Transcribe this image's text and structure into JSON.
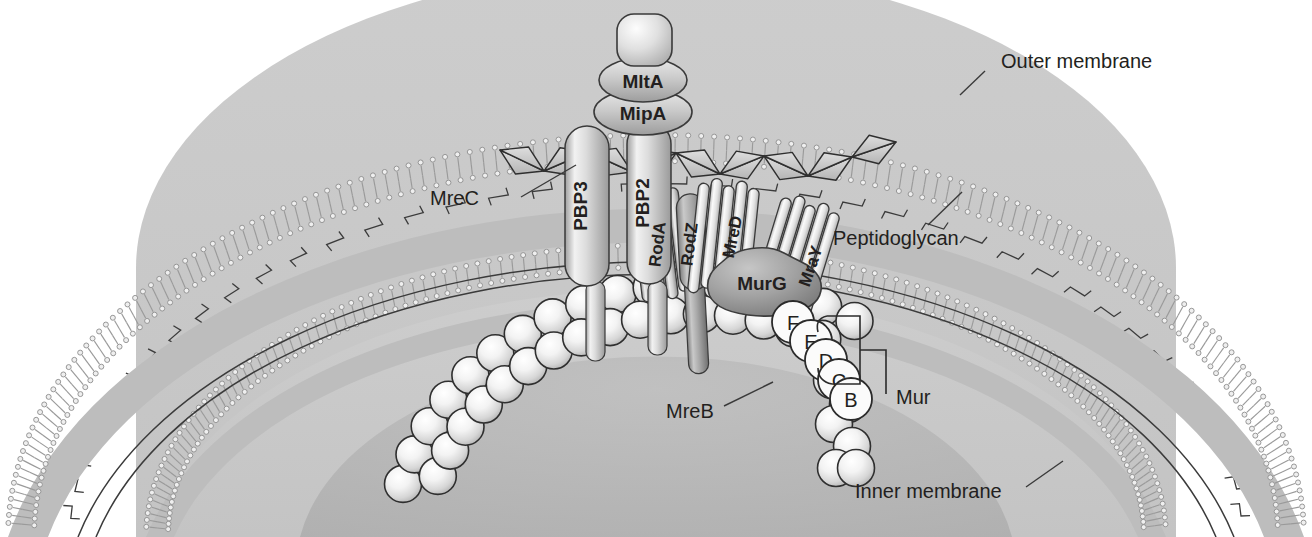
{
  "figure": {
    "type": "biological-schematic"
  },
  "labels": {
    "outer_membrane": "Outer membrane",
    "peptidoglycan": "Peptidoglycan",
    "inner_membrane": "Inner membrane",
    "mrec": "MreC",
    "mreb": "MreB",
    "mur": "Mur"
  },
  "proteins": {
    "mlta": "MltA",
    "mipa": "MipA",
    "pbp3": "PBP3",
    "pbp2": "PBP2",
    "roda": "RodA",
    "rodz": "RodZ",
    "mred": "MreD",
    "murg": "MurG",
    "mray": "MraY"
  },
  "mur_enzymes": [
    {
      "letter": "F"
    },
    {
      "letter": "E"
    },
    {
      "letter": "D"
    },
    {
      "letter": "C"
    },
    {
      "letter": "B"
    }
  ],
  "colors": {
    "background": "#ffffff",
    "periplasm": "#ffffff",
    "cytoplasm_outer": "#c9c9c9",
    "cytoplasm_inner": "#b4b4b4",
    "membrane_fill": "#b9b9b9",
    "membrane_head": "#d8d8d8",
    "outline": "#2e2e2e",
    "text": "#231f20",
    "protein_light": "#e8e8e8",
    "protein_mid": "#c2c2c2",
    "protein_dark": "#8d8d8d",
    "sphere_highlight": "#ffffff",
    "glycan_fill": "#cfcfcf"
  },
  "layers": {
    "outer_membrane_label_anchor": "upper-right",
    "peptidoglycan_label_anchor": "mid-right",
    "inner_membrane_label_anchor": "lower-right"
  }
}
